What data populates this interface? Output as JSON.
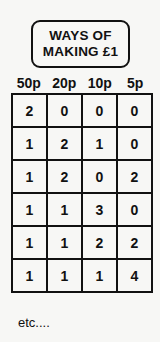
{
  "title": {
    "line1": "WAYS OF",
    "line2": "MAKING £1"
  },
  "table": {
    "headers": [
      "50p",
      "20p",
      "10p",
      "5p"
    ],
    "rows": [
      [
        "2",
        "0",
        "0",
        "0"
      ],
      [
        "1",
        "2",
        "1",
        "0"
      ],
      [
        "1",
        "2",
        "0",
        "2"
      ],
      [
        "1",
        "1",
        "3",
        "0"
      ],
      [
        "1",
        "1",
        "2",
        "2"
      ],
      [
        "1",
        "1",
        "1",
        "4"
      ]
    ]
  },
  "footer": "etc...."
}
